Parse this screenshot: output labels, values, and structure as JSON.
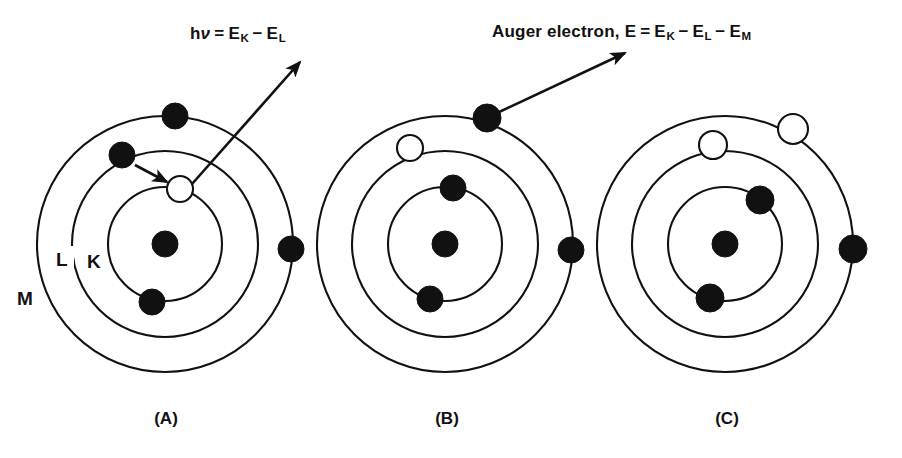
{
  "figure": {
    "background_color": "#ffffff",
    "ink_color": "#111111"
  },
  "annotations": {
    "photon": {
      "prefix": "h",
      "nu": "ν",
      "equals": "=",
      "term1_base": "E",
      "term1_sub": "K",
      "minus1": "−",
      "term2_base": "E",
      "term2_sub": "L",
      "full_text": "hν = E_K − E_L"
    },
    "auger": {
      "lead": "Auger electron,",
      "energy_symbol": "E",
      "equals": "=",
      "term1_base": "E",
      "term1_sub": "K",
      "minus1": "−",
      "term2_base": "E",
      "term2_sub": "L",
      "minus2": "−",
      "term3_base": "E",
      "term3_sub": "M",
      "full_text": "Auger electron, E = E_K − E_L − E_M"
    }
  },
  "shell_labels": {
    "k": "K",
    "l": "L",
    "m": "M"
  },
  "panels": [
    {
      "id": "A",
      "label": "(A)",
      "caption_x": 166,
      "caption_y": 424,
      "center": {
        "x": 165,
        "y": 244
      },
      "shells": [
        {
          "name": "K",
          "radius": 57
        },
        {
          "name": "L",
          "radius": 93
        },
        {
          "name": "M",
          "radius": 128
        }
      ],
      "nucleus": {
        "x": 165,
        "y": 244,
        "r": 13
      },
      "particles": [
        {
          "kind": "vacancy",
          "shell": "K",
          "x": 180,
          "y": 189,
          "r": 13
        },
        {
          "kind": "filled",
          "shell": "K",
          "x": 152,
          "y": 302,
          "r": 13
        },
        {
          "kind": "filled",
          "shell": "L",
          "x": 122,
          "y": 155,
          "r": 13
        },
        {
          "kind": "filled",
          "shell": "M",
          "x": 175,
          "y": 116,
          "r": 13
        },
        {
          "kind": "filled",
          "shell": "M",
          "x": 291,
          "y": 249,
          "r": 13
        }
      ],
      "arrows": [
        {
          "name": "electron-transition-arrow",
          "from": {
            "x": 133,
            "y": 164
          },
          "to": {
            "x": 168,
            "y": 183
          }
        },
        {
          "name": "photon-emission-arrow",
          "from": {
            "x": 192,
            "y": 185
          },
          "to": {
            "x": 300,
            "y": 62
          }
        }
      ]
    },
    {
      "id": "B",
      "label": "(B)",
      "caption_x": 447,
      "caption_y": 424,
      "center": {
        "x": 445,
        "y": 244
      },
      "shells": [
        {
          "name": "K",
          "radius": 57
        },
        {
          "name": "L",
          "radius": 93
        },
        {
          "name": "M",
          "radius": 128
        }
      ],
      "nucleus": {
        "x": 445,
        "y": 244,
        "r": 13
      },
      "particles": [
        {
          "kind": "filled",
          "shell": "K",
          "x": 453,
          "y": 188,
          "r": 13
        },
        {
          "kind": "filled",
          "shell": "K",
          "x": 430,
          "y": 299,
          "r": 13
        },
        {
          "kind": "vacancy",
          "shell": "L",
          "x": 410,
          "y": 148,
          "r": 13
        },
        {
          "kind": "filled",
          "shell": "M",
          "x": 487,
          "y": 118,
          "r": 14
        },
        {
          "kind": "filled",
          "shell": "M",
          "x": 571,
          "y": 250,
          "r": 13
        }
      ],
      "arrows": [
        {
          "name": "auger-electron-arrow",
          "from": {
            "x": 497,
            "y": 113
          },
          "to": {
            "x": 625,
            "y": 53
          }
        }
      ]
    },
    {
      "id": "C",
      "label": "(C)",
      "caption_x": 727,
      "caption_y": 424,
      "center": {
        "x": 725,
        "y": 244
      },
      "shells": [
        {
          "name": "K",
          "radius": 57
        },
        {
          "name": "L",
          "radius": 93
        },
        {
          "name": "M",
          "radius": 128
        }
      ],
      "nucleus": {
        "x": 725,
        "y": 244,
        "r": 13
      },
      "particles": [
        {
          "kind": "filled",
          "shell": "K",
          "x": 760,
          "y": 200,
          "r": 14
        },
        {
          "kind": "filled",
          "shell": "K",
          "x": 710,
          "y": 298,
          "r": 14
        },
        {
          "kind": "vacancy",
          "shell": "L",
          "x": 713,
          "y": 145,
          "r": 14
        },
        {
          "kind": "vacancy",
          "shell": "M",
          "x": 793,
          "y": 129,
          "r": 15
        },
        {
          "kind": "filled",
          "shell": "M",
          "x": 853,
          "y": 249,
          "r": 14
        }
      ],
      "arrows": []
    }
  ],
  "shell_label_positions": [
    {
      "key": "k",
      "x": 93,
      "y": 265
    },
    {
      "key": "l",
      "x": 62,
      "y": 262
    },
    {
      "key": "m",
      "x": 22,
      "y": 301
    }
  ]
}
